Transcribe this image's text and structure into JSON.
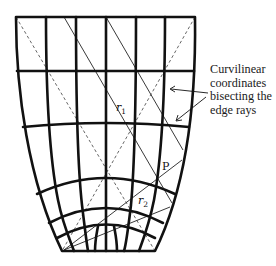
{
  "figure": {
    "type": "curvilinear grid diagram",
    "annotation": {
      "lines": [
        "Curvilinear",
        "coordinates",
        "bisecting the",
        "edge rays"
      ]
    },
    "labels": {
      "r1": "r",
      "r1_sub": "1",
      "r2": "r",
      "r2_sub": "2",
      "point": "P"
    },
    "colors": {
      "grid": "#111111",
      "rays": "#222222",
      "dashed": "#555555",
      "background": "#ffffff"
    }
  }
}
